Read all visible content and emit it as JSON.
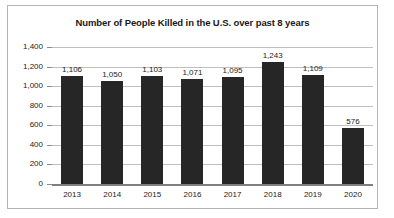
{
  "chart_data": {
    "type": "bar",
    "title": "Number of People Killed in the U.S. over past 8 years",
    "xlabel": "",
    "ylabel": "",
    "categories": [
      "2013",
      "2014",
      "2015",
      "2016",
      "2017",
      "2018",
      "2019",
      "2020"
    ],
    "values": [
      1106,
      1050,
      1103,
      1071,
      1095,
      1243,
      1109,
      576
    ],
    "data_labels": [
      "1,106",
      "1,050",
      "1,103",
      "1,071",
      "1,095",
      "1,243",
      "1,109",
      "576"
    ],
    "ylim": [
      0,
      1400
    ],
    "ytick_values": [
      0,
      200,
      400,
      600,
      800,
      1000,
      1200,
      1400
    ],
    "ytick_labels": [
      "0",
      "200",
      "400",
      "600",
      "800",
      "1,000",
      "1,200",
      "1,400"
    ],
    "grid": true,
    "legend": false,
    "legend_position": "none",
    "bar_color": "#262626",
    "gridline_color": "#bfbfbf",
    "border_color": "#b3b3b3",
    "background_color": "#ffffff"
  }
}
